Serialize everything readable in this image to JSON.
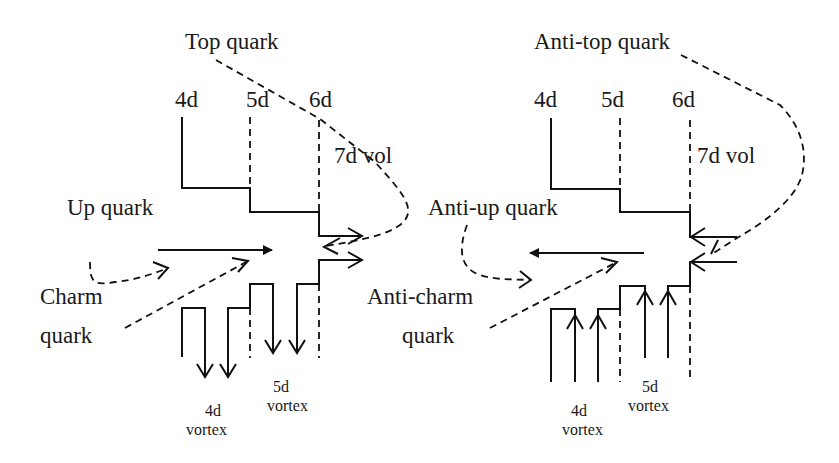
{
  "diagrams": [
    {
      "id": "quark",
      "labels": {
        "top": "Top quark",
        "up": "Up quark",
        "charm_line1": "Charm",
        "charm_line2": "quark",
        "dim4": "4d",
        "dim5": "5d",
        "dim6": "6d",
        "vol7": "7d vol",
        "vortex4_line1": "4d",
        "vortex4_line2": "vortex",
        "vortex5_line1": "5d",
        "vortex5_line2": "vortex"
      },
      "main_arrow_direction": "right",
      "vortex_arrow_direction": "down"
    },
    {
      "id": "antiquark",
      "labels": {
        "top": "Anti-top quark",
        "up": "Anti-up quark",
        "charm_line1": "Anti-charm",
        "charm_line2": "quark",
        "dim4": "4d",
        "dim5": "5d",
        "dim6": "6d",
        "vol7": "7d vol",
        "vortex4_line1": "4d",
        "vortex4_line2": "vortex",
        "vortex5_line1": "5d",
        "vortex5_line2": "vortex"
      },
      "main_arrow_direction": "left",
      "vortex_arrow_direction": "up"
    }
  ]
}
